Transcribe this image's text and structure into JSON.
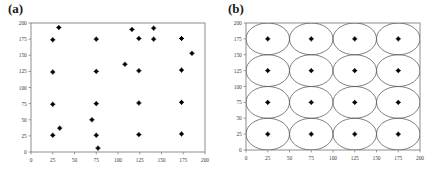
{
  "figure": {
    "panels": [
      {
        "label": "(a)",
        "name": "panel-a"
      },
      {
        "label": "(b)",
        "name": "panel-b"
      }
    ],
    "axis_color": "#808080",
    "marker_color": "#000000",
    "curve_color": "#555555"
  },
  "chart_data": [
    {
      "type": "scatter",
      "title": "(a)",
      "xlabel": "",
      "ylabel": "",
      "xlim": [
        0,
        200
      ],
      "ylim": [
        0,
        200
      ],
      "xticks": [
        0,
        25,
        50,
        75,
        100,
        125,
        150,
        175,
        200
      ],
      "yticks": [
        0,
        25,
        50,
        75,
        100,
        125,
        150,
        175,
        200
      ],
      "grid": false,
      "legend": "none",
      "marker": "filled-square",
      "points": [
        {
          "x": 25,
          "y": 26
        },
        {
          "x": 25,
          "y": 74
        },
        {
          "x": 25,
          "y": 124
        },
        {
          "x": 25,
          "y": 174
        },
        {
          "x": 33,
          "y": 37
        },
        {
          "x": 32,
          "y": 193
        },
        {
          "x": 70,
          "y": 50
        },
        {
          "x": 75,
          "y": 26
        },
        {
          "x": 75,
          "y": 75
        },
        {
          "x": 75,
          "y": 125
        },
        {
          "x": 75,
          "y": 175
        },
        {
          "x": 77,
          "y": 6
        },
        {
          "x": 108,
          "y": 136
        },
        {
          "x": 116,
          "y": 190
        },
        {
          "x": 124,
          "y": 27
        },
        {
          "x": 124,
          "y": 76
        },
        {
          "x": 124,
          "y": 126
        },
        {
          "x": 124,
          "y": 176
        },
        {
          "x": 141,
          "y": 192
        },
        {
          "x": 141,
          "y": 175
        },
        {
          "x": 173,
          "y": 28
        },
        {
          "x": 173,
          "y": 77
        },
        {
          "x": 173,
          "y": 127
        },
        {
          "x": 173,
          "y": 176
        },
        {
          "x": 185,
          "y": 153
        }
      ]
    },
    {
      "type": "scatter",
      "title": "(b)",
      "xlabel": "",
      "ylabel": "",
      "xlim": [
        0,
        200
      ],
      "ylim": [
        0,
        200
      ],
      "xticks": [
        0,
        25,
        50,
        75,
        100,
        125,
        150,
        175,
        200
      ],
      "yticks": [
        0,
        25,
        50,
        75,
        100,
        125,
        150,
        175,
        200
      ],
      "grid": false,
      "legend": "none",
      "marker": "filled-square",
      "points": [
        {
          "x": 25,
          "y": 25
        },
        {
          "x": 25,
          "y": 75
        },
        {
          "x": 25,
          "y": 125
        },
        {
          "x": 25,
          "y": 175
        },
        {
          "x": 75,
          "y": 25
        },
        {
          "x": 75,
          "y": 75
        },
        {
          "x": 75,
          "y": 125
        },
        {
          "x": 75,
          "y": 175
        },
        {
          "x": 125,
          "y": 25
        },
        {
          "x": 125,
          "y": 75
        },
        {
          "x": 125,
          "y": 125
        },
        {
          "x": 125,
          "y": 175
        },
        {
          "x": 175,
          "y": 25
        },
        {
          "x": 175,
          "y": 75
        },
        {
          "x": 175,
          "y": 125
        },
        {
          "x": 175,
          "y": 175
        }
      ],
      "overlay": {
        "shape": "circle",
        "radius": 25,
        "centers_x": [
          25,
          75,
          125,
          175
        ],
        "centers_y": [
          25,
          75,
          125,
          175
        ]
      }
    }
  ]
}
